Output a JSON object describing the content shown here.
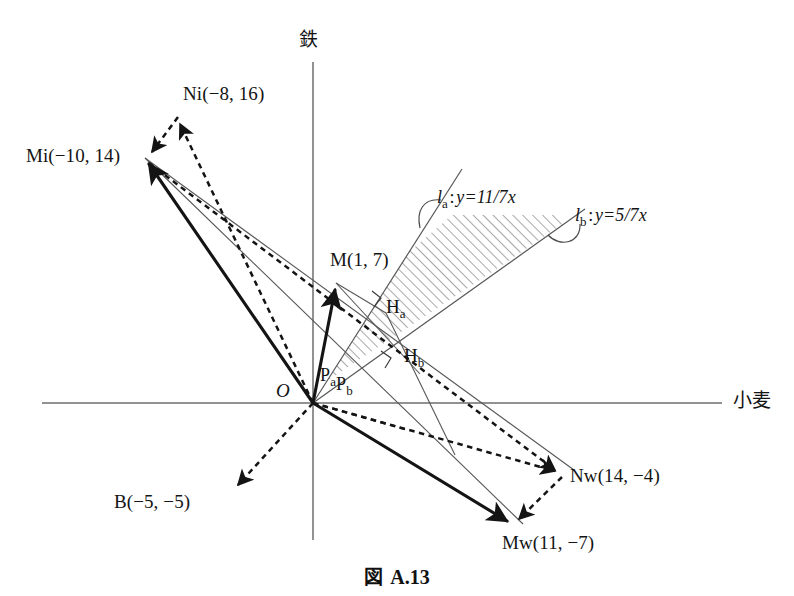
{
  "figure": {
    "caption_prefix": "図",
    "caption_number": "A.13",
    "axis_y_label": "鉄",
    "axis_x_label": "小麦",
    "origin_label": "O"
  },
  "points": [
    {
      "key": "Ni",
      "label": "Ni(−8, 16)",
      "x": -8,
      "y": 16
    },
    {
      "key": "Mi",
      "label": "Mi(−10, 14)",
      "x": -10,
      "y": 14
    },
    {
      "key": "M",
      "label": "M(1, 7)",
      "x": 1,
      "y": 7
    },
    {
      "key": "B",
      "label": "B(−5, −5)",
      "x": -5,
      "y": -5
    },
    {
      "key": "Nw",
      "label": "Nw(14, −4)",
      "x": 14,
      "y": -4
    },
    {
      "key": "Mw",
      "label": "Mw(11, −7)",
      "x": 11,
      "y": -7
    }
  ],
  "foot_points": [
    {
      "key": "Ha",
      "base": "H",
      "subscript": "a"
    },
    {
      "key": "Hb",
      "base": "H",
      "subscript": "b"
    },
    {
      "key": "Pa",
      "base": "P",
      "subscript": "a"
    },
    {
      "key": "Pb",
      "base": "P",
      "subscript": "b"
    }
  ],
  "lines": [
    {
      "key": "la",
      "name": "l",
      "subscript": "a",
      "equation": "y=11/7x",
      "slope": 1.5714285714,
      "full_label": "l_a : y=11/7x"
    },
    {
      "key": "lb",
      "name": "l",
      "subscript": "b",
      "equation": "y=5/7x",
      "slope": 0.7142857143,
      "full_label": "l_b : y=5/7x"
    }
  ],
  "colors": {
    "ink": "#141414",
    "axis": "#6e6e6e",
    "thin_line": "#555555",
    "hatch": "#606060",
    "background": "#ffffff"
  },
  "geometry": {
    "origin_px": {
      "x": 313,
      "y": 403
    },
    "scale_px_per_unit": 17.8,
    "axis_x_from_px": 42,
    "axis_x_to_px": 722,
    "axis_y_from_px": 62,
    "axis_y_to_px": 540
  }
}
